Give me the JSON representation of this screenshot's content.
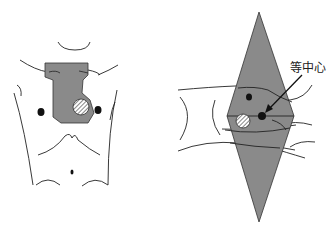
{
  "figure": {
    "left_panel": {
      "name": "anterior view torso with irregular treatment field",
      "field_color": "#8a8a8a"
    },
    "right_panel": {
      "name": "lateral view with diamond beam field",
      "field_color": "#8a8a8a",
      "isocenter_label": "等中心"
    }
  }
}
